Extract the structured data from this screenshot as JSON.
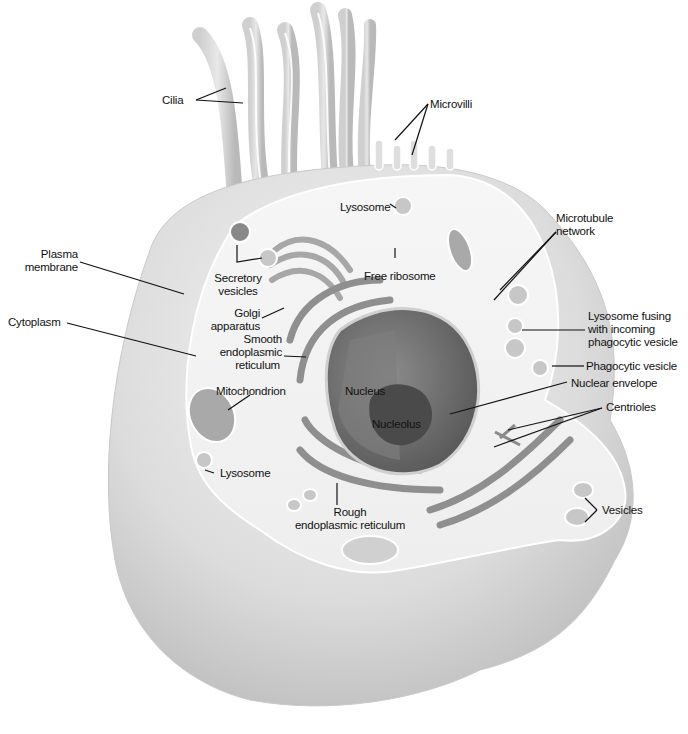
{
  "labels": {
    "cilia": "Cilia",
    "microvilli": "Microvilli",
    "lysosome_top": "Lysosome",
    "microtubule_network_1": "Microtubule",
    "microtubule_network_2": "network",
    "plasma_membrane_1": "Plasma",
    "plasma_membrane_2": "membrane",
    "secretory_vesicles_1": "Secretory",
    "secretory_vesicles_2": "vesicles",
    "free_ribosome": "Free ribosome",
    "cytoplasm": "Cytoplasm",
    "golgi_1": "Golgi",
    "golgi_2": "apparatus",
    "smooth_er_1": "Smooth",
    "smooth_er_2": "endoplasmic",
    "smooth_er_3": "reticulum",
    "lysosome_fusing_1": "Lysosome fusing",
    "lysosome_fusing_2": "with incoming",
    "lysosome_fusing_3": "phagocytic vesicle",
    "phagocytic_vesicle": "Phagocytic vesicle",
    "nuclear_envelope": "Nuclear envelope",
    "mitochondrion": "Mitochondrion",
    "nucleus": "Nucleus",
    "nucleolus": "Nucleolus",
    "centrioles": "Centrioles",
    "lysosome_bottom": "Lysosome",
    "rough_er_1": "Rough",
    "rough_er_2": "endoplasmic reticulum",
    "vesicles": "Vesicles"
  },
  "colors": {
    "background": "#ffffff",
    "cell_outer": "#d9d9d9",
    "cell_surface": "#f2f2f2",
    "cytoplasm_surface": "#f7f7f7",
    "organelle": "#9a9a9a",
    "nucleus": "#6e6e6e",
    "nucleolus": "#4a4a4a",
    "leader_line": "#111111"
  }
}
